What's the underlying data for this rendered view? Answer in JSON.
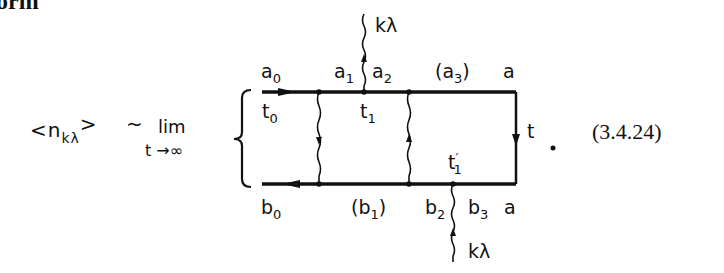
{
  "heading_fragment": "orm",
  "equation": {
    "lhs": {
      "open": "<n",
      "sub": "kλ",
      "close": ">"
    },
    "relation": "~",
    "limit": {
      "word": "lim",
      "subscript": "t →∞"
    },
    "number": "(3.4.24)",
    "trailing_dot": "."
  },
  "diagram": {
    "top_labels": [
      {
        "base": "a",
        "sub": "0",
        "pre": "",
        "post": ""
      },
      {
        "base": "a",
        "sub": "1",
        "pre": "",
        "post": ""
      },
      {
        "base": "a",
        "sub": "2",
        "pre": "",
        "post": ""
      },
      {
        "base": "a",
        "sub": "3",
        "pre": "(",
        "post": ")"
      },
      {
        "base": "a",
        "sub": "",
        "pre": "",
        "post": ""
      }
    ],
    "bottom_labels": [
      {
        "base": "b",
        "sub": "0",
        "pre": "",
        "post": ""
      },
      {
        "base": "b",
        "sub": "1",
        "pre": "(",
        "post": ")"
      },
      {
        "base": "b",
        "sub": "2",
        "pre": "",
        "post": ""
      },
      {
        "base": "b",
        "sub": "3",
        "pre": "",
        "post": ""
      },
      {
        "base": "a",
        "sub": "",
        "pre": "",
        "post": ""
      }
    ],
    "time_labels": [
      {
        "base": "t",
        "sub": "0",
        "prime": ""
      },
      {
        "base": "t",
        "sub": "1",
        "prime": ""
      },
      {
        "base": "t",
        "sub": "1",
        "prime": "′"
      },
      {
        "base": "t",
        "sub": "",
        "prime": ""
      }
    ],
    "photon_top_label": "kλ",
    "photon_bottom_label": "kλ"
  }
}
